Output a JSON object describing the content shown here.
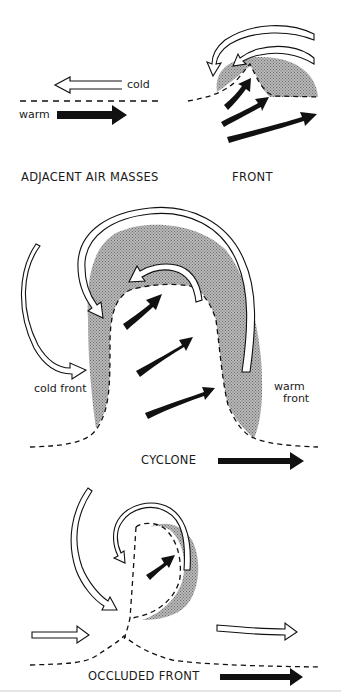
{
  "diagram": {
    "colors": {
      "ink": "#111111",
      "shading": "#a8a8a8",
      "background": "#ffffff"
    },
    "panels": [
      {
        "id": "adjacent-air-masses",
        "caption": "ADJACENT AIR MASSES",
        "labels": {
          "cold": "cold",
          "warm": "warm"
        }
      },
      {
        "id": "front",
        "caption": "FRONT"
      },
      {
        "id": "cyclone",
        "caption": "CYCLONE",
        "labels": {
          "cold_front": "cold front",
          "warm_front_line1": "warm",
          "warm_front_line2": "front"
        }
      },
      {
        "id": "occluded-front",
        "caption": "OCCLUDED FRONT"
      }
    ],
    "legend_semantics": {
      "open_arrow": "cold air flow",
      "solid_arrow": "warm air flow",
      "dashed_line": "frontal boundary",
      "stippled_area": "cloud / precipitation zone"
    }
  }
}
